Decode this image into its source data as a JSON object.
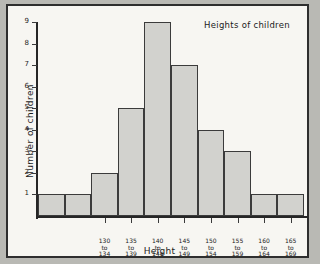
{
  "chart_data": {
    "type": "bar",
    "title": "Heights of children",
    "xlabel": "Height",
    "ylabel": "Number of children",
    "categories": [
      "",
      "",
      "130\nto\n134",
      "135\nto\n139",
      "140\nto\n144",
      "145\nto\n149",
      "150\nto\n154",
      "155\nto\n159",
      "160\nto\n164",
      "165\nto\n169"
    ],
    "values": [
      1,
      1,
      2,
      5,
      9,
      7,
      4,
      3,
      1,
      1
    ],
    "ylim": [
      0,
      9
    ],
    "yticks": [
      "1",
      "2",
      "3",
      "4",
      "5",
      "6",
      "7",
      "8",
      "9"
    ],
    "grid": false,
    "legend": "none",
    "bar_fill": "#d2d2ce",
    "bar_stroke": "#3b3b3b",
    "axis_color": "#262626",
    "paper_color": "#f7f6f2",
    "margin_color": "#b9b9b4"
  },
  "bins": [
    {
      "label": "",
      "value": 1
    },
    {
      "label": "",
      "value": 1
    },
    {
      "label": "130\nto\n134",
      "value": 2
    },
    {
      "label": "135\nto\n139",
      "value": 5
    },
    {
      "label": "140\nto\n144",
      "value": 9
    },
    {
      "label": "145\nto\n149",
      "value": 7
    },
    {
      "label": "150\nto\n154",
      "value": 4
    },
    {
      "label": "155\nto\n159",
      "value": 3
    },
    {
      "label": "160\nto\n164",
      "value": 1
    },
    {
      "label": "165\nto\n169",
      "value": 1
    }
  ]
}
